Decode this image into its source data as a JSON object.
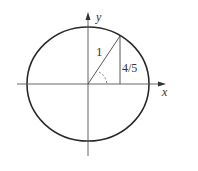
{
  "diagram": {
    "type": "unit-circle",
    "labels": {
      "hypotenuse": "1",
      "opposite": "4/5",
      "x_axis": "x",
      "y_axis": "y"
    },
    "colors": {
      "stroke": "#333333",
      "circle": "#2a2a2a",
      "background": "#ffffff"
    },
    "geometry": {
      "center": [
        88,
        84
      ],
      "radius_x": 61,
      "radius_y": 57,
      "point_on_circle": [
        120,
        36
      ]
    }
  }
}
